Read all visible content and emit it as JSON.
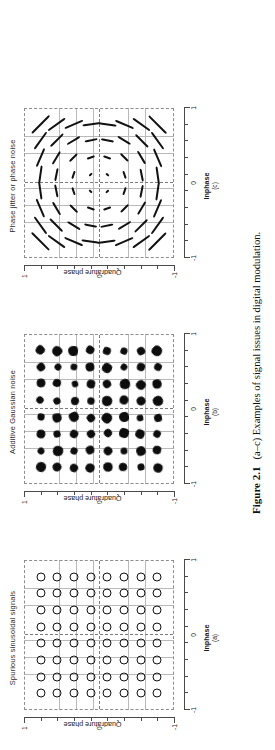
{
  "figure": {
    "number": "Figure 2.1",
    "caption": "(a–c) Examples of signal issues in digital modulation.",
    "orientation_degrees": -90
  },
  "axes_common": {
    "x_label": "Inphase",
    "y_label": "Quadrature phase",
    "x_ticks": [
      "-1",
      "0",
      "1"
    ],
    "y_ticks": [
      "-1",
      "0",
      "1"
    ],
    "x_range": [
      -1,
      1
    ],
    "y_range": [
      -1,
      1
    ],
    "grid": "dotted 8x8 constellation grid"
  },
  "panels": [
    {
      "id": "a",
      "sub_label": "(a)",
      "title": "Spurious sinusoidal signals",
      "x_label": "Inphase",
      "y_label": "Quadrature phase",
      "symbol": "open-circle",
      "description": "64-QAM constellation where each ideal symbol is smeared into a ring by an additive spurious sinusoid"
    },
    {
      "id": "b",
      "sub_label": "(b)",
      "title": "Additive Gaussian noise",
      "x_label": "Inphase",
      "y_label": "Quadrature phase",
      "symbol": "filled-blob",
      "description": "64-QAM constellation where each symbol becomes a filled circular cloud of scattered samples"
    },
    {
      "id": "c",
      "sub_label": "(c)",
      "title": "Phase jitter or phase noise",
      "x_label": "Inphase",
      "y_label": "Quadrature phase",
      "symbol": "tangential-arc",
      "description": "64-QAM constellation where each symbol is smeared into an arc tangential to a circle centred on the origin; arc length grows with radius"
    }
  ],
  "chart_data": {
    "type": "scatter",
    "title": "(a–c) Examples of signal issues in digital modulation.",
    "xlabel": "Inphase",
    "ylabel": "Quadrature phase",
    "xlim": [
      -1,
      1
    ],
    "ylim": [
      -1,
      1
    ],
    "xticks": [
      -1,
      0,
      1
    ],
    "yticks": [
      -1,
      0,
      1
    ],
    "grid": true,
    "legend": "none",
    "constellation": "64-QAM, 8 x 8 grid",
    "symbol_coordinates": [
      -0.778,
      -0.556,
      -0.333,
      -0.111,
      0.111,
      0.333,
      0.556,
      0.778
    ],
    "series": [
      {
        "name": "Spurious sinusoidal signals",
        "panel": "a",
        "marker": "open circle (ring)",
        "points": 64,
        "impairment": "spurious tone -> ring of constant radius around each symbol",
        "ring_radius": 0.055
      },
      {
        "name": "Additive Gaussian noise",
        "panel": "b",
        "marker": "filled cloud",
        "points": 64,
        "impairment": "AWGN -> isotropic Gaussian cloud around each symbol",
        "cloud_sigma": 0.035
      },
      {
        "name": "Phase jitter or phase noise",
        "panel": "c",
        "marker": "tangential arc",
        "points": 64,
        "impairment": "phase noise -> arc smear perpendicular to radius, length proportional to magnitude",
        "phase_spread_radians": 0.13
      }
    ]
  }
}
